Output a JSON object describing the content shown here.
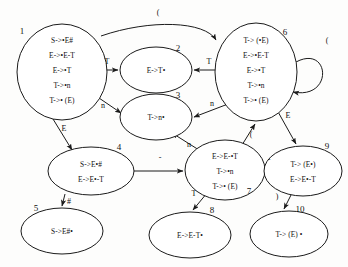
{
  "diagram": {
    "states": [
      {
        "id": "1",
        "number": "1",
        "cx": 62,
        "cy": 72,
        "rx": 45,
        "ry": 48,
        "num_x": 22,
        "num_y": 34,
        "items": [
          "S->•E#",
          "E->•E-T",
          "E->•T",
          "T->•n",
          "T->• (E)"
        ]
      },
      {
        "id": "2",
        "number": "2",
        "cx": 156,
        "cy": 70,
        "rx": 36,
        "ry": 23,
        "num_x": 178,
        "num_y": 51,
        "items": [
          "E->T•"
        ]
      },
      {
        "id": "3",
        "number": "3",
        "cx": 156,
        "cy": 117,
        "rx": 36,
        "ry": 23,
        "num_x": 178,
        "num_y": 98,
        "items": [
          "T->n•"
        ]
      },
      {
        "id": "4",
        "number": "4",
        "cx": 91,
        "cy": 171,
        "rx": 43,
        "ry": 24,
        "num_x": 119,
        "num_y": 150,
        "items": [
          "S->E•#",
          "E->E•-T"
        ]
      },
      {
        "id": "5",
        "number": "5",
        "cx": 62,
        "cy": 231,
        "rx": 41,
        "ry": 23,
        "num_x": 36,
        "num_y": 211,
        "items": [
          "S->E#•"
        ]
      },
      {
        "id": "6",
        "number": "6",
        "cx": 256,
        "cy": 72,
        "rx": 41,
        "ry": 49,
        "num_x": 285,
        "num_y": 35,
        "items": [
          "T-> (•E)",
          "E->•E-T",
          "E->•T",
          "T->•n",
          "T->• (E)"
        ]
      },
      {
        "id": "7",
        "number": "7",
        "cx": 225,
        "cy": 170,
        "rx": 40,
        "ry": 30,
        "num_x": 249,
        "num_y": 194,
        "items": [
          "E->E-•T",
          "T->•n",
          "T->• (E)"
        ]
      },
      {
        "id": "8",
        "number": "8",
        "cx": 190,
        "cy": 235,
        "rx": 41,
        "ry": 23,
        "num_x": 212,
        "num_y": 213,
        "items": [
          "E->E-T•"
        ]
      },
      {
        "id": "9",
        "number": "9",
        "cx": 303,
        "cy": 171,
        "rx": 39,
        "ry": 25,
        "num_x": 327,
        "num_y": 149,
        "items": [
          "T-> (E•)",
          "E->E•-T"
        ]
      },
      {
        "id": "10",
        "number": "10",
        "cx": 289,
        "cy": 234,
        "rx": 39,
        "ry": 23,
        "num_x": 300,
        "num_y": 212,
        "items": [
          "T-> (E) •"
        ]
      }
    ],
    "edges": [
      {
        "id": "e1-6",
        "from": "1",
        "to": "6",
        "label": "(",
        "label_x": 158,
        "label_y": 15
      },
      {
        "id": "e1-2",
        "from": "1",
        "to": "2",
        "label": "T",
        "label_x": 107,
        "label_y": 64
      },
      {
        "id": "e1-3",
        "from": "1",
        "to": "3",
        "label": "n",
        "label_x": 103,
        "label_y": 108
      },
      {
        "id": "e1-4",
        "from": "1",
        "to": "4",
        "label": "E",
        "label_x": 64,
        "label_y": 131
      },
      {
        "id": "e4-5",
        "from": "4",
        "to": "5",
        "label": "#",
        "label_x": 69,
        "label_y": 204
      },
      {
        "id": "e4-7",
        "from": "4",
        "to": "7",
        "label": "-",
        "label_x": 160,
        "label_y": 160
      },
      {
        "id": "e6-2",
        "from": "6",
        "to": "2",
        "label": "T",
        "label_x": 209,
        "label_y": 64
      },
      {
        "id": "e6-3",
        "from": "6",
        "to": "3",
        "label": "n",
        "label_x": 212,
        "label_y": 106
      },
      {
        "id": "e6-6",
        "from": "6",
        "to": "6",
        "label": "(",
        "label_x": 327,
        "label_y": 43
      },
      {
        "id": "e6-9",
        "from": "6",
        "to": "9",
        "label": "E",
        "label_x": 288,
        "label_y": 118
      },
      {
        "id": "e7-3",
        "from": "7",
        "to": "3",
        "label": "n",
        "label_x": 189,
        "label_y": 147
      },
      {
        "id": "e7-6",
        "from": "7",
        "to": "6",
        "label": "(",
        "label_x": 251,
        "label_y": 137
      },
      {
        "id": "e7-8",
        "from": "7",
        "to": "8",
        "label": "T",
        "label_x": 194,
        "label_y": 196
      },
      {
        "id": "e9-7",
        "from": "9",
        "to": "7",
        "label": "-",
        "label_x": 269,
        "label_y": 162
      },
      {
        "id": "e9-10",
        "from": "9",
        "to": "10",
        "label": ")",
        "label_x": 277,
        "label_y": 199
      }
    ]
  }
}
